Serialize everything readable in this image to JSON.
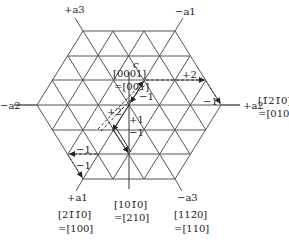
{
  "figure": {
    "type": "hexagonal-lattice-basal-plane",
    "axis_labels": {
      "plus_a3": "+a3",
      "minus_a1": "−a1",
      "minus_a2": "−a2",
      "plus_a2": "+a2",
      "plus_a1": "+a1",
      "minus_a3": "−a3"
    },
    "direction_labels": {
      "c": "c",
      "c_4index": "[0001]",
      "c_3index": "=[001]",
      "a2_4index": "[1̄21̄0]",
      "a2_3index": "=[010]",
      "a1_4index": "[21̄1̄0]",
      "a1_3index": "=[100]",
      "d210_4index": "[101̄0]",
      "d210_3index": "=[210]",
      "a12_4index": "[112̄0]",
      "a12_3index": "=[110]"
    },
    "step_labels": {
      "upper_right_plus2": "+2",
      "upper_right_minus1": "−1",
      "center_minus1": "−1",
      "center_plus2": "+2",
      "center_plus1": "+1",
      "center_minus1_lower": "−1",
      "lower_left_minus1_a": "−1",
      "lower_left_minus1_b": "−1"
    },
    "colors": {
      "lines": "#444444",
      "text": "#222222",
      "background": "#ffffff"
    }
  }
}
